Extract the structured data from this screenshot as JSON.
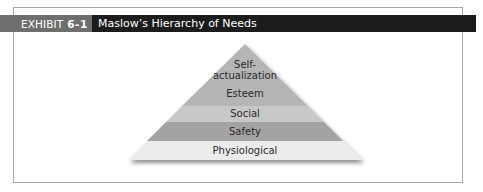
{
  "header": {
    "exhibit_label": "EXHIBIT",
    "exhibit_number": "6-1",
    "title": "Maslow’s Hierarchy of Needs"
  },
  "pyramid": {
    "levels": [
      {
        "label_line1": "Self-",
        "label_line2": "actualization",
        "color": "#b5b5b5"
      },
      {
        "label": "Esteem",
        "color": "#b5b5b5"
      },
      {
        "label": "Social",
        "color": "#c8c8c8"
      },
      {
        "label": "Safety",
        "color": "#a3a3a3"
      },
      {
        "label": "Physiological",
        "color": "#ececec"
      }
    ]
  },
  "colors": {
    "header_label_bg": "#6e6e6e",
    "header_title_bg": "#1c1c1c",
    "frame_border": "#a8a8a8"
  }
}
